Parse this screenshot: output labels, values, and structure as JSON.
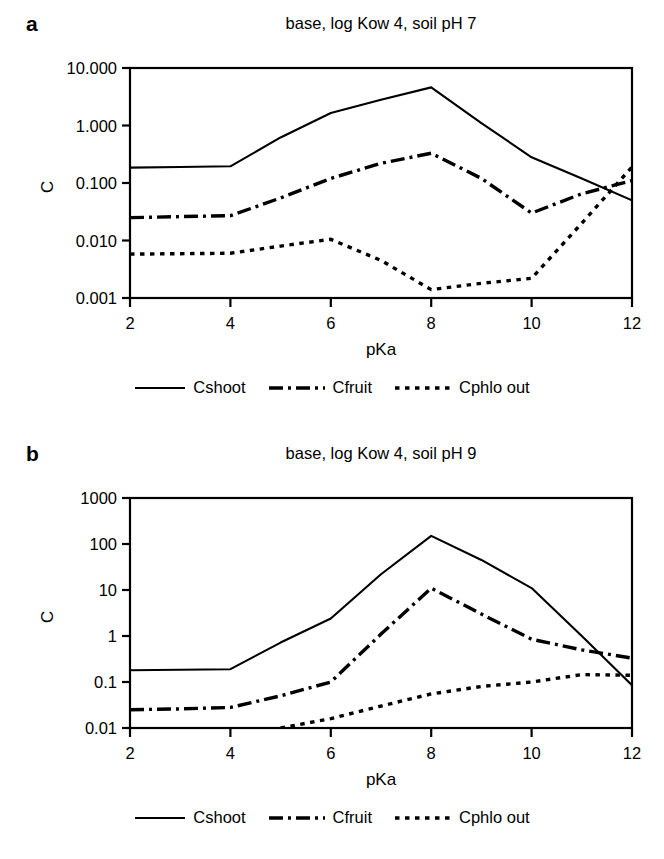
{
  "figure": {
    "axis_label_x": "pKa",
    "axis_label_y": "C",
    "series_names": [
      "Cshoot",
      "Cfruit",
      "Cphlo out"
    ]
  },
  "legend": {
    "items": [
      {
        "label": "Cshoot",
        "style": "solid",
        "swatch": "line-solid-icon"
      },
      {
        "label": "Cfruit",
        "style": "dash-dot",
        "swatch": "line-dashdot-icon"
      },
      {
        "label": "Cphlo out",
        "style": "dotted",
        "swatch": "line-dotted-icon"
      }
    ]
  },
  "panels": [
    {
      "key": "a",
      "label": "a",
      "title": "base, log Kow 4, soil pH 7",
      "xlabel": "pKa",
      "ylabel": "C",
      "xticklabels": [
        "2",
        "4",
        "6",
        "8",
        "10",
        "12"
      ],
      "yticklabels": [
        "0.001",
        "0.010",
        "0.100",
        "1.000",
        "10.000"
      ]
    },
    {
      "key": "b",
      "label": "b",
      "title": "base, log Kow 4, soil pH 9",
      "xlabel": "pKa",
      "ylabel": "C",
      "xticklabels": [
        "2",
        "4",
        "6",
        "8",
        "10",
        "12"
      ],
      "yticklabels": [
        "0.01",
        "0.1",
        "1",
        "10",
        "100",
        "1000"
      ]
    }
  ],
  "chart_data": [
    {
      "type": "line",
      "panel": "a",
      "title": "base, log Kow 4, soil pH 7",
      "xlabel": "pKa",
      "ylabel": "C",
      "yscale": "log",
      "ylim": [
        0.001,
        10
      ],
      "xlim": [
        2,
        12
      ],
      "yticks": [
        0.001,
        0.01,
        0.1,
        1,
        10
      ],
      "yticklabels": [
        "0.001",
        "0.010",
        "0.100",
        "1.000",
        "10.000"
      ],
      "xticks": [
        2,
        4,
        6,
        8,
        10,
        12
      ],
      "grid": false,
      "legend_position": "below",
      "x": [
        2,
        3,
        4,
        5,
        6,
        7,
        8,
        9,
        10,
        11,
        12
      ],
      "series": [
        {
          "name": "Cshoot",
          "style": "solid",
          "values": [
            0.185,
            0.19,
            0.195,
            0.62,
            1.65,
            2.8,
            4.6,
            1.1,
            0.28,
            0.12,
            0.05
          ]
        },
        {
          "name": "Cfruit",
          "style": "dash-dot",
          "values": [
            0.025,
            0.026,
            0.027,
            0.055,
            0.12,
            0.22,
            0.33,
            0.12,
            0.03,
            0.065,
            0.11
          ]
        },
        {
          "name": "Cphlo out",
          "style": "dotted",
          "values": [
            0.0058,
            0.0059,
            0.006,
            0.008,
            0.0105,
            0.0045,
            0.0014,
            0.0018,
            0.0022,
            0.02,
            0.19
          ]
        }
      ]
    },
    {
      "type": "line",
      "panel": "b",
      "title": "base, log Kow 4, soil pH 9",
      "xlabel": "pKa",
      "ylabel": "C",
      "yscale": "log",
      "ylim": [
        0.01,
        1000
      ],
      "xlim": [
        2,
        12
      ],
      "yticks": [
        0.01,
        0.1,
        1,
        10,
        100,
        1000
      ],
      "yticklabels": [
        "0.01",
        "0.1",
        "1",
        "10",
        "100",
        "1000"
      ],
      "xticks": [
        2,
        4,
        6,
        8,
        10,
        12
      ],
      "grid": false,
      "legend_position": "below",
      "x": [
        2,
        3,
        4,
        5,
        6,
        7,
        8,
        9,
        10,
        11,
        12
      ],
      "series": [
        {
          "name": "Cshoot",
          "style": "solid",
          "values": [
            0.18,
            0.185,
            0.19,
            0.72,
            2.4,
            22,
            150,
            45,
            11,
            1.0,
            0.085
          ]
        },
        {
          "name": "Cfruit",
          "style": "dash-dot",
          "values": [
            0.025,
            0.026,
            0.028,
            0.05,
            0.1,
            1.1,
            11,
            3.0,
            0.85,
            0.5,
            0.33
          ]
        },
        {
          "name": "Cphlo out",
          "style": "dotted",
          "values": [
            0.0,
            0.0,
            0.0,
            0.0098,
            0.016,
            0.03,
            0.055,
            0.08,
            0.1,
            0.145,
            0.14
          ]
        }
      ]
    }
  ]
}
